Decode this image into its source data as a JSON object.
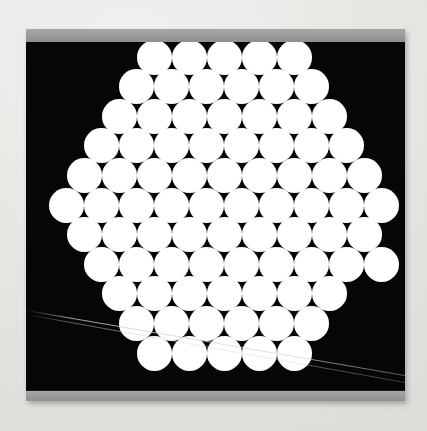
{
  "page": {
    "background_color": "#ececea",
    "width": 427,
    "height": 431
  },
  "specimen": {
    "frame_color": "#121212",
    "clamp_color": "#9d9d9d",
    "field_color": "#060606",
    "fiber_color": "#ffffff",
    "frame": {
      "x": 26,
      "y": 29,
      "width": 379,
      "height": 372
    },
    "clamp_top": {
      "height": 13,
      "label": "top-clamp-bar"
    },
    "clamp_bottom": {
      "height": 10,
      "label": "bottom-clamp-bar"
    },
    "dark_field": {
      "x": 0,
      "y": 13,
      "width": 379,
      "height": 349
    }
  },
  "packing": {
    "arrangement": "hexagonal-close-packed",
    "fiber_diameter": 35,
    "row_pitch": 29.6,
    "column_pitch": 35,
    "row_count": 11,
    "fiber_count": 81,
    "rows": [
      {
        "index": 0,
        "count": 5,
        "x_start": 128.0,
        "y_center": 15.0
      },
      {
        "index": 1,
        "count": 6,
        "x_start": 110.5,
        "y_center": 44.6
      },
      {
        "index": 2,
        "count": 7,
        "x_start": 93.0,
        "y_center": 74.2
      },
      {
        "index": 3,
        "count": 8,
        "x_start": 75.5,
        "y_center": 103.8
      },
      {
        "index": 4,
        "count": 9,
        "x_start": 58.0,
        "y_center": 133.4
      },
      {
        "index": 5,
        "count": 10,
        "x_start": 40.5,
        "y_center": 163.0
      },
      {
        "index": 6,
        "count": 9,
        "x_start": 58.0,
        "y_center": 192.6
      },
      {
        "index": 7,
        "count": 9,
        "x_start": 75.5,
        "y_center": 222.2
      },
      {
        "index": 8,
        "count": 7,
        "x_start": 93.0,
        "y_center": 251.8
      },
      {
        "index": 9,
        "count": 6,
        "x_start": 110.5,
        "y_center": 281.4
      },
      {
        "index": 10,
        "count": 5,
        "x_start": 128.0,
        "y_center": 311.0
      }
    ]
  },
  "artifacts": {
    "scratches": [
      {
        "name": "stray-filament-upper",
        "x1": 0,
        "y1": 268,
        "x2": 379,
        "y2": 333,
        "opacity": 0.9
      },
      {
        "name": "stray-filament-lower",
        "x1": 0,
        "y1": 272,
        "x2": 379,
        "y2": 340,
        "opacity": 0.55
      }
    ]
  }
}
